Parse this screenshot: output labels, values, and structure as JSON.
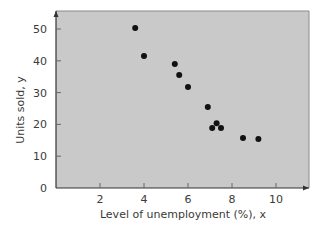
{
  "chart_data": {
    "type": "scatter",
    "title": "",
    "xlabel": "Level of unemployment (%), x",
    "ylabel": "Units sold, y",
    "xlim": [
      0,
      11.5
    ],
    "ylim": [
      0,
      56
    ],
    "x_ticks": [
      2,
      4,
      6,
      8,
      10
    ],
    "y_ticks": [
      0,
      10,
      20,
      30,
      40,
      50
    ],
    "grid": false,
    "legend": null,
    "series": [
      {
        "name": "observations",
        "points": [
          {
            "x": 3.6,
            "y": 50.3
          },
          {
            "x": 4.0,
            "y": 41.5
          },
          {
            "x": 5.4,
            "y": 39.0
          },
          {
            "x": 5.6,
            "y": 35.5
          },
          {
            "x": 6.0,
            "y": 31.8
          },
          {
            "x": 6.9,
            "y": 25.5
          },
          {
            "x": 7.1,
            "y": 18.9
          },
          {
            "x": 7.3,
            "y": 20.4
          },
          {
            "x": 7.5,
            "y": 18.9
          },
          {
            "x": 8.5,
            "y": 15.7
          },
          {
            "x": 9.2,
            "y": 15.4
          }
        ]
      }
    ]
  },
  "colors": {
    "plot_bg": "#c9c9c9",
    "axis": "#333333",
    "point": "#111111",
    "frame": "#8a8a8a"
  }
}
